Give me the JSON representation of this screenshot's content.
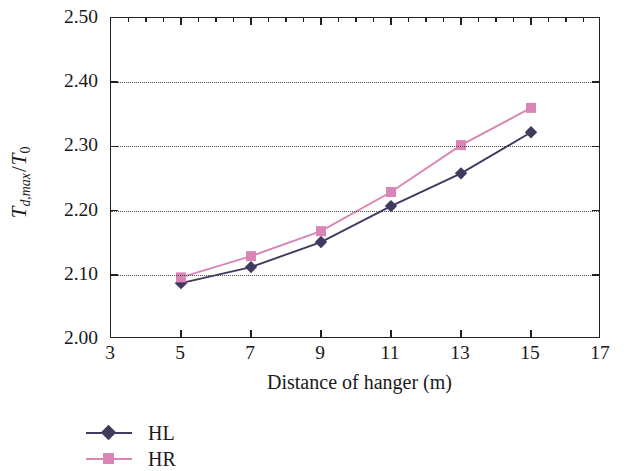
{
  "chart_data": {
    "type": "line",
    "title": "",
    "xlabel": "Distance of hanger (m)",
    "ylabel": "T_d,max / T_0",
    "ylabel_parts": {
      "main": "T",
      "sub": "d,max",
      "slash": "/",
      "main2": "T",
      "sub2": "0"
    },
    "x": [
      5,
      7,
      9,
      11,
      13,
      15
    ],
    "xlim": [
      3,
      17
    ],
    "ylim": [
      2.0,
      2.5
    ],
    "xticks": [
      "3",
      "5",
      "7",
      "9",
      "11",
      "13",
      "15",
      "17"
    ],
    "xtick_values": [
      3,
      5,
      7,
      9,
      11,
      13,
      15,
      17
    ],
    "yticks": [
      "2.00",
      "2.10",
      "2.20",
      "2.30",
      "2.40",
      "2.50"
    ],
    "ytick_values": [
      2.0,
      2.1,
      2.2,
      2.3,
      2.4,
      2.5
    ],
    "grid": true,
    "grid_axis": "y",
    "grid_style": "dotted",
    "legend_position": "below-left",
    "series": [
      {
        "name": "HL",
        "color": "#3f3a5e",
        "marker": "diamond",
        "values": [
          2.087,
          2.112,
          2.151,
          2.207,
          2.258,
          2.322
        ]
      },
      {
        "name": "HR",
        "color": "#d985b6",
        "marker": "square",
        "values": [
          2.096,
          2.129,
          2.168,
          2.229,
          2.302,
          2.36
        ]
      }
    ]
  },
  "legend": {
    "items": [
      {
        "label": "HL"
      },
      {
        "label": "HR"
      }
    ]
  },
  "colors": {
    "axis": "#231f20",
    "grid": "#4a4a4a",
    "background": "#ffffff",
    "series_hl": "#3f3a5e",
    "series_hr": "#d985b6"
  }
}
